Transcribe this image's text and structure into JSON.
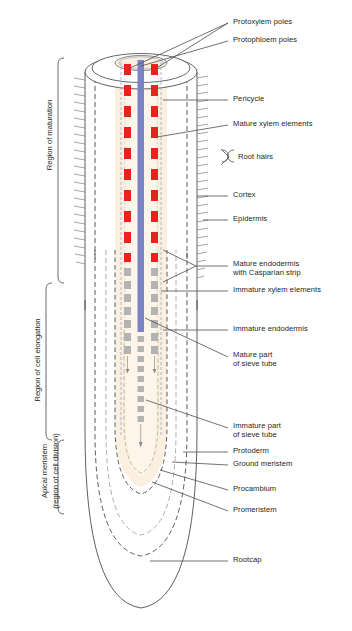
{
  "figure": {
    "type": "biological-diagram"
  },
  "colors": {
    "xylem_mature": "#e8231f",
    "xylem_immature": "#b3b3b3",
    "sieve_tube_mature": "#7c83c4",
    "sieve_tube_immature": "#b3b3b3",
    "cortex_fill": "#fbeede",
    "stele_fill": "#fdf4e6",
    "outline": "#4d4d4d",
    "leader": "#58595b",
    "text": "#231f20",
    "endodermis_dash": "#8c8c8c",
    "pericycle_dash": "#9aa7c4"
  },
  "region_labels": [
    {
      "id": "region-of-maturation",
      "text": "Region of maturation"
    },
    {
      "id": "region-of-cell-elongation",
      "text": "Region of cell elongation"
    },
    {
      "id": "apical-meristem-line1",
      "text": "Apical meristem"
    },
    {
      "id": "apical-meristem-line2",
      "text": "(region of cell division)"
    }
  ],
  "callouts": [
    {
      "id": "protoxylem-poles",
      "text": "Protoxylem poles",
      "x": 233,
      "y": 22
    },
    {
      "id": "protophloem-poles",
      "text": "Protophloem poles",
      "x": 233,
      "y": 40
    },
    {
      "id": "pericycle",
      "text": "Pericycle",
      "x": 233,
      "y": 97
    },
    {
      "id": "mature-xylem-elements",
      "text": "Mature xylem elements",
      "x": 233,
      "y": 122
    },
    {
      "id": "root-hairs",
      "text": "Root hairs",
      "x": 238,
      "y": 157
    },
    {
      "id": "cortex",
      "text": "Cortex",
      "x": 233,
      "y": 193
    },
    {
      "id": "epidermis",
      "text": "Epidermis",
      "x": 233,
      "y": 217
    },
    {
      "id": "mature-endodermis-1",
      "text": "Mature endodermis",
      "x": 233,
      "y": 262
    },
    {
      "id": "mature-endodermis-2",
      "text": "with Casparian strip",
      "x": 233,
      "y": 271
    },
    {
      "id": "immature-xylem-elements",
      "text": "Immature xylem elements",
      "x": 233,
      "y": 288
    },
    {
      "id": "immature-endodermis",
      "text": "Immature endodermis",
      "x": 233,
      "y": 327
    },
    {
      "id": "mature-sieve-1",
      "text": "Mature part",
      "x": 233,
      "y": 353
    },
    {
      "id": "mature-sieve-2",
      "text": "of sieve tube",
      "x": 233,
      "y": 362
    },
    {
      "id": "immature-sieve-1",
      "text": "Immature part",
      "x": 233,
      "y": 424
    },
    {
      "id": "immature-sieve-2",
      "text": "of sieve tube",
      "x": 233,
      "y": 433
    },
    {
      "id": "protoderm",
      "text": "Protoderm",
      "x": 233,
      "y": 449
    },
    {
      "id": "ground-meristem",
      "text": "Ground meristem",
      "x": 233,
      "y": 462
    },
    {
      "id": "procambium",
      "text": "Procambium",
      "x": 233,
      "y": 487
    },
    {
      "id": "promeristem",
      "text": "Promeristem",
      "x": 233,
      "y": 508
    },
    {
      "id": "rootcap",
      "text": "Rootcap",
      "x": 233,
      "y": 558
    }
  ],
  "structure": {
    "xylem_mature_blocks": 10,
    "xylem_immature_blocks": 9,
    "root_hair_ticks_left": 22,
    "root_hair_ticks_right": 26,
    "sieve_tube_mature_top": 62,
    "sieve_tube_mature_bottom": 330,
    "sieve_tube_immature_top": 333,
    "sieve_tube_immature_bottom": 432
  }
}
